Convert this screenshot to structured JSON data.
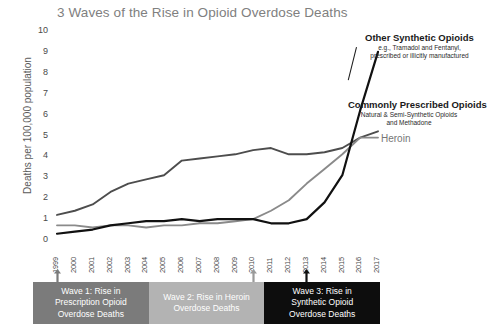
{
  "chart_data": {
    "type": "line",
    "title": "3 Waves of the Rise in Opioid Overdose Deaths",
    "xlabel": "",
    "ylabel": "Deaths per 100,000 population",
    "ylim": [
      0,
      10
    ],
    "xlim": [
      1999,
      2017
    ],
    "grid": false,
    "legend_position": "inline-annotations",
    "x": [
      1999,
      2000,
      2001,
      2002,
      2003,
      2004,
      2005,
      2006,
      2007,
      2008,
      2009,
      2010,
      2011,
      2012,
      2013,
      2014,
      2015,
      2016,
      2017
    ],
    "categories": [
      "1999",
      "2000",
      "2001",
      "2002",
      "2003",
      "2004",
      "2005",
      "2006",
      "2007",
      "2008",
      "2009",
      "2010",
      "2011",
      "2012",
      "2013",
      "2014",
      "2015",
      "2016",
      "2017"
    ],
    "y_ticks": [
      "10",
      "9",
      "8",
      "7",
      "6",
      "5",
      "4",
      "3",
      "2",
      "1",
      "0"
    ],
    "series": [
      {
        "name": "Commonly Prescribed Opioids",
        "subtitle": "Natural & Semi-Synthetic Opioids and Methadone",
        "color": "#4d4d4d",
        "values": [
          1.2,
          1.4,
          1.7,
          2.3,
          2.7,
          2.9,
          3.1,
          3.8,
          3.9,
          4.0,
          4.1,
          4.3,
          4.4,
          4.1,
          4.1,
          4.2,
          4.4,
          4.9,
          5.2
        ]
      },
      {
        "name": "Heroin",
        "subtitle": "",
        "color": "#8a8a8a",
        "values": [
          0.7,
          0.7,
          0.6,
          0.7,
          0.7,
          0.6,
          0.7,
          0.7,
          0.8,
          0.8,
          0.9,
          1.0,
          1.4,
          1.9,
          2.7,
          3.4,
          4.1,
          4.9,
          4.9
        ]
      },
      {
        "name": "Other Synthetic Opioids",
        "subtitle": "e.g., Tramadol and Fentanyl, prescribed or illicitly manufactured",
        "color": "#111111",
        "values": [
          0.3,
          0.4,
          0.5,
          0.7,
          0.8,
          0.9,
          0.9,
          1.0,
          0.9,
          1.0,
          1.0,
          1.0,
          0.8,
          0.8,
          1.0,
          1.8,
          3.1,
          6.2,
          9.0
        ]
      }
    ],
    "annotations": [
      {
        "label": "Other Synthetic Opioids",
        "sub": "e.g., Tramadol and Fentanyl, prescribed or illicitly manufactured"
      },
      {
        "label": "Commonly Prescribed Opioids",
        "sub": "Natural & Semi-Synthetic Opioids and Methadone"
      },
      {
        "label": "Heroin",
        "sub": ""
      }
    ],
    "waves": [
      {
        "label": "Wave 1: Rise in Prescription Opioid Overdose Deaths",
        "start_year": 1999,
        "color": "#7b7b7b"
      },
      {
        "label": "Wave 2: Rise in Heroin Overdose Deaths",
        "start_year": 2010,
        "color": "#b3b3b3"
      },
      {
        "label": "Wave 3: Rise in Synthetic Opioid Overdose Deaths",
        "start_year": 2013,
        "color": "#0d0d0d"
      }
    ],
    "markers": [
      {
        "year": "1999",
        "color": "#7b7b7b"
      },
      {
        "year": "2010",
        "color": "#9a9a9a"
      },
      {
        "year": "2013",
        "color": "#111111"
      }
    ]
  },
  "annotation_text": {
    "synthetic_title": "Other Synthetic Opioids",
    "synthetic_sub_line1": "e.g., Tramadol and Fentanyl,",
    "synthetic_sub_line2": "prescribed or illicitly manufactured",
    "prescribed_title": "Commonly Prescribed Opioids",
    "prescribed_sub_line1": "Natural & Semi-Synthetic Opioids",
    "prescribed_sub_line2": "and Methadone",
    "heroin_title": "Heroin"
  },
  "waves_text": {
    "wave1_line1": "Wave 1: Rise in",
    "wave1_line2": "Prescription Opioid",
    "wave1_line3": "Overdose Deaths",
    "wave2_line1": "Wave 2: Rise in Heroin",
    "wave2_line2": "Overdose Deaths",
    "wave3_line1": "Wave 3: Rise in",
    "wave3_line2": "Synthetic Opioid",
    "wave3_line3": "Overdose Deaths"
  }
}
